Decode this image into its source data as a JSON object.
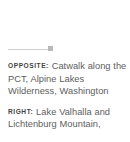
{
  "page": {
    "background_color": "#ffffff",
    "text_color": "#5e5e5e",
    "label_color": "#444444",
    "rule_color": "#cfcfcf",
    "rule_cap_color": "#b9b9b9"
  },
  "divider": {
    "name": "section-divider",
    "cap_shape": "square"
  },
  "captions": [
    {
      "label": "OPPOSITE:",
      "text": "Catwalk along the PCT, Alpine Lakes Wilderness, Washington"
    },
    {
      "label": "RIGHT:",
      "text": "Lake Valhalla and Lichtenburg Mountain,"
    }
  ]
}
